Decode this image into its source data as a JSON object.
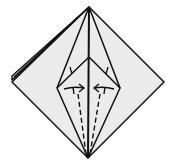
{
  "diagram": {
    "colors": {
      "paper": "#ebebeb",
      "line": "#111111",
      "background": "#ffffff"
    },
    "points": {
      "top": [
        89,
        7
      ],
      "bottom": [
        88,
        158
      ],
      "left": [
        12,
        82
      ],
      "right": [
        164,
        82
      ],
      "left_back": [
        12,
        76
      ],
      "kite_left": [
        57,
        88
      ],
      "kite_right": [
        120,
        88
      ],
      "inner_apex": [
        89,
        57
      ]
    },
    "annotations": [
      {
        "type": "valley-fold-dashed",
        "side": "left"
      },
      {
        "type": "valley-fold-dashed",
        "side": "right"
      },
      {
        "type": "arrow",
        "direction": "right",
        "side": "left"
      },
      {
        "type": "arrow",
        "direction": "left",
        "side": "right"
      }
    ]
  }
}
